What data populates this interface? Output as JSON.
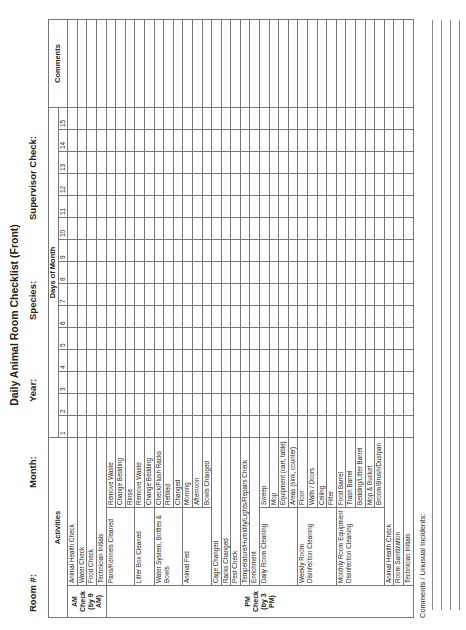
{
  "title": "Daily Animal Room Checklist (Front)",
  "header_fields": [
    {
      "label": "Room #:",
      "value": ""
    },
    {
      "label": "Month:",
      "value": ""
    },
    {
      "label": "Year:",
      "value": ""
    },
    {
      "label": "Species:",
      "value": ""
    },
    {
      "label": "Supervisor Check:",
      "value": ""
    }
  ],
  "table": {
    "activities_header": "Activities",
    "days_header": "Days of Month",
    "comments_header": "Comments",
    "days": [
      "1",
      "2",
      "3",
      "4",
      "5",
      "6",
      "7",
      "8",
      "9",
      "10",
      "11",
      "12",
      "13",
      "14",
      "15"
    ],
    "am_label": "AM Check (by 9 AM)",
    "pm_label": "PM Check (by 3 PM)",
    "am_rows": [
      "Animal Health Check",
      "Water Check",
      "Food Check",
      "Technician Initials"
    ],
    "groups": [
      {
        "label": "Pans/Kennels Cleaned",
        "items": [
          "Remove Waste",
          "Change Bedding",
          "Rinse"
        ]
      },
      {
        "label": "Litter Box Cleaned",
        "items": [
          "Remove Waste",
          "Change Bedding"
        ]
      },
      {
        "label": "Water System, Bottles & Bowls",
        "items": [
          "Check/Flush Racks",
          "Refilled",
          "Changed"
        ]
      },
      {
        "label": "Animal Fed",
        "items": [
          "Morning",
          "Afternoon",
          "Bowls Changed"
        ]
      }
    ],
    "pm_single_rows": [
      "Cage Changed",
      "Racks Changed",
      "Pest Check",
      "Temperature/Humidity/Lights/Repairs Check",
      "Enrichment"
    ],
    "pm_groups": [
      {
        "label": "Daily Room Cleaning",
        "items": [
          "Sweep",
          "Mop",
          "Equipment (cart, table)",
          "Areas (sink, counter)"
        ]
      },
      {
        "label": "Weekly Room Disinfection Cleaning",
        "items": [
          "Floor",
          "Walls / Doors",
          "Ceiling",
          "Filter"
        ]
      },
      {
        "label": "Monthly Room Equipment Disinfection Cleaning",
        "items": [
          "Food Barrel",
          "Trash Barrel",
          "Bedding/Litter Barrel",
          "Mop & Bucket",
          "Broom/Brush/Dustpan"
        ]
      }
    ],
    "pm_end_rows": [
      "Animal Health Check",
      "Room Sanitization",
      "Technician Initials"
    ]
  },
  "footer": {
    "comments_label": "Comments / Unusual Incidents:"
  }
}
